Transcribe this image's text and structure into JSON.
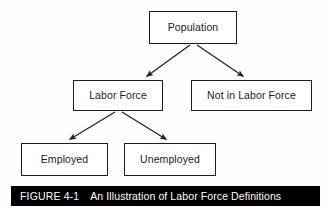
{
  "figure": {
    "caption_label": "FIGURE 4-1",
    "caption_title": "An Illustration of Labor Force Definitions",
    "caption_bar_color": "#000000",
    "caption_text_color": "#ffffff",
    "background_color": "#ffffff",
    "node_border_color": "#1d1d1d",
    "node_fill_color": "#ffffff",
    "connector_color": "#1d1d1d"
  },
  "diagram": {
    "type": "flowchart",
    "orientation": "top-down",
    "nodes": [
      {
        "id": "population",
        "label": "Population"
      },
      {
        "id": "labor_force",
        "label": "Labor Force"
      },
      {
        "id": "not_in_lf",
        "label": "Not in Labor Force"
      },
      {
        "id": "employed",
        "label": "Employed"
      },
      {
        "id": "unemployed",
        "label": "Unemployed"
      }
    ],
    "edges": [
      {
        "from": "population",
        "to": "labor_force",
        "arrow": "arrowhead"
      },
      {
        "from": "population",
        "to": "not_in_lf",
        "arrow": "arrowhead"
      },
      {
        "from": "labor_force",
        "to": "employed",
        "arrow": "arrowhead"
      },
      {
        "from": "labor_force",
        "to": "unemployed",
        "arrow": "arrowhead"
      }
    ]
  }
}
